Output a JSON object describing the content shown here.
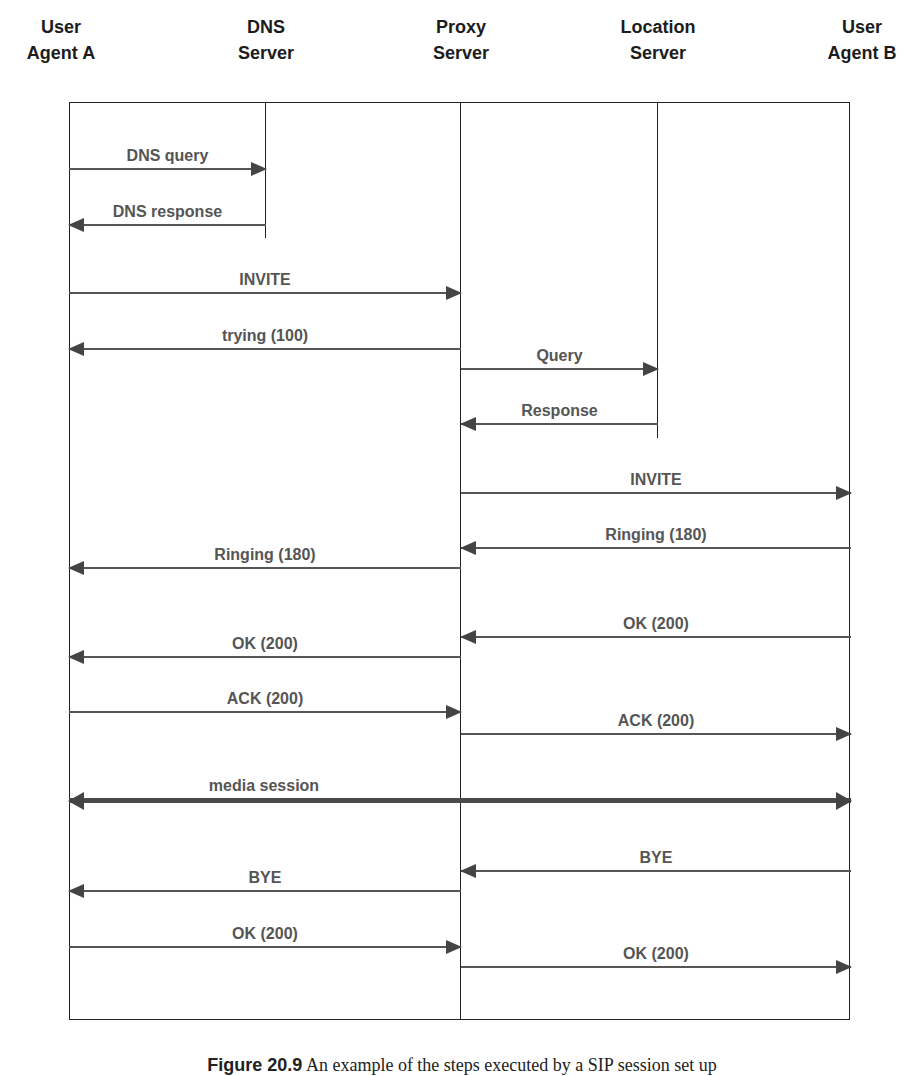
{
  "participants": [
    {
      "id": "ua_a",
      "line1": "User",
      "line2": "Agent A",
      "x": 69
    },
    {
      "id": "dns",
      "line1": "DNS",
      "line2": "Server",
      "x": 266
    },
    {
      "id": "proxy",
      "line1": "Proxy",
      "line2": "Server",
      "x": 461
    },
    {
      "id": "location",
      "line1": "Location",
      "line2": "Server",
      "x": 658
    },
    {
      "id": "ua_b",
      "line1": "User",
      "line2": "Agent B",
      "x": 851
    }
  ],
  "messages": [
    {
      "label": "DNS query",
      "from": "ua_a",
      "to": "dns",
      "y": 169
    },
    {
      "label": "DNS response",
      "from": "dns",
      "to": "ua_a",
      "y": 225
    },
    {
      "label": "INVITE",
      "from": "ua_a",
      "to": "proxy",
      "y": 293
    },
    {
      "label": "trying (100)",
      "from": "proxy",
      "to": "ua_a",
      "y": 349
    },
    {
      "label": "Query",
      "from": "proxy",
      "to": "location",
      "y": 369
    },
    {
      "label": "Response",
      "from": "location",
      "to": "proxy",
      "y": 424
    },
    {
      "label": "INVITE",
      "from": "proxy",
      "to": "ua_b",
      "y": 493
    },
    {
      "label": "Ringing (180)",
      "from": "ua_b",
      "to": "proxy",
      "y": 548
    },
    {
      "label": "Ringing (180)",
      "from": "proxy",
      "to": "ua_a",
      "y": 568
    },
    {
      "label": "OK (200)",
      "from": "ua_b",
      "to": "proxy",
      "y": 637
    },
    {
      "label": "OK (200)",
      "from": "proxy",
      "to": "ua_a",
      "y": 657
    },
    {
      "label": "ACK (200)",
      "from": "ua_a",
      "to": "proxy",
      "y": 712
    },
    {
      "label": "ACK (200)",
      "from": "proxy",
      "to": "ua_b",
      "y": 734
    },
    {
      "label": "media session",
      "from": "ua_a",
      "to": "ua_b",
      "y": 801,
      "bidirectional": true
    },
    {
      "label": "BYE",
      "from": "ua_b",
      "to": "proxy",
      "y": 871
    },
    {
      "label": "BYE",
      "from": "proxy",
      "to": "ua_a",
      "y": 891
    },
    {
      "label": "OK (200)",
      "from": "ua_a",
      "to": "proxy",
      "y": 947
    },
    {
      "label": "OK (200)",
      "from": "proxy",
      "to": "ua_b",
      "y": 967
    }
  ],
  "caption": {
    "figure_label": "Figure 20.9",
    "text": "An example of the steps executed by a SIP session set up"
  },
  "colors": {
    "line": "#222222",
    "arrow": "#555555",
    "label": "#555555"
  }
}
